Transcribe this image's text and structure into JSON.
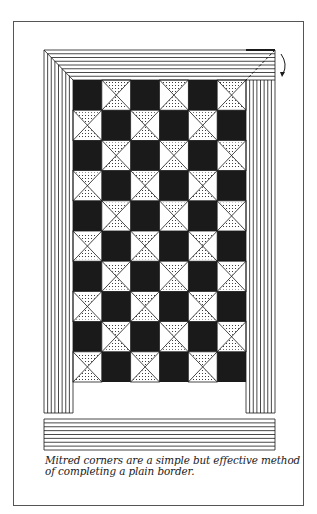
{
  "figure": {
    "caption_lines": [
      "Mitred corners are a simple but effective method",
      "of completing a plain border."
    ],
    "colors": {
      "ink": "#1a1a1a",
      "paper": "#ffffff",
      "frame": "#555555"
    },
    "quilt": {
      "columns": 6,
      "rows": 10,
      "first_cell": "solid-black",
      "alternate_cell": "hourglass-dotted",
      "border_stripes": 8
    },
    "annotations": {
      "fold_line": "dashed-diagonal",
      "fold_arrow": "curved-arrow"
    }
  }
}
